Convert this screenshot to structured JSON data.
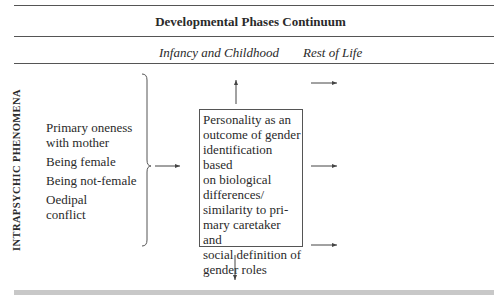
{
  "header": {
    "title": "Developmental Phases Continuum",
    "phases": [
      "Infancy and Childhood",
      "Rest of Life"
    ]
  },
  "side_label": "INTRAPSYCHIC PHENOMENA",
  "phenomena": [
    "Primary oneness with mother",
    "Being female",
    "Being not-female",
    "Oedipal conflict"
  ],
  "phenomena_lines": [
    [
      "Primary oneness",
      "with mother"
    ],
    [
      "Being female"
    ],
    [
      "Being not-female"
    ],
    [
      "Oedipal",
      "conflict"
    ]
  ],
  "outcome_box": {
    "lines": [
      "Personality as an",
      "outcome of gender",
      "identification based",
      "on biological",
      "differences/",
      "similarity to pri-",
      "mary caretaker and",
      "social definition of",
      "gender roles"
    ]
  },
  "colors": {
    "rule": "#555555",
    "text": "#2a2a2a",
    "band": "#c8c8c8"
  }
}
